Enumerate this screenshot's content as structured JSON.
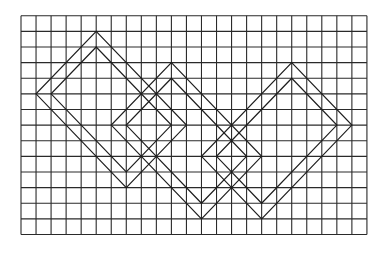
{
  "figure": {
    "background": "#ffffff",
    "line_color": "#2a2a2a",
    "grid": {
      "columns": 23,
      "rows": 14,
      "origin_x": 21,
      "origin_y": 15.7,
      "cell_width": 15.04,
      "cell_height": 15.63
    },
    "shapes": [
      {
        "name": "diamond-left",
        "outer": [
          [
            5,
            1
          ],
          [
            11,
            7
          ],
          [
            7,
            11
          ],
          [
            1,
            5
          ]
        ],
        "inner": [
          [
            5,
            2
          ],
          [
            10,
            7
          ],
          [
            7,
            10
          ],
          [
            2,
            5
          ]
        ]
      },
      {
        "name": "diamond-middle",
        "outer": [
          [
            10,
            3
          ],
          [
            16,
            9
          ],
          [
            12,
            13
          ],
          [
            6,
            7
          ]
        ],
        "inner": [
          [
            10,
            4
          ],
          [
            15,
            9
          ],
          [
            12,
            12
          ],
          [
            7,
            7
          ]
        ]
      },
      {
        "name": "diamond-right",
        "outer": [
          [
            18,
            3
          ],
          [
            22,
            7
          ],
          [
            16,
            13
          ],
          [
            12,
            9
          ]
        ],
        "inner": [
          [
            18,
            4
          ],
          [
            21,
            7
          ],
          [
            16,
            12
          ],
          [
            13,
            9
          ]
        ]
      }
    ]
  }
}
